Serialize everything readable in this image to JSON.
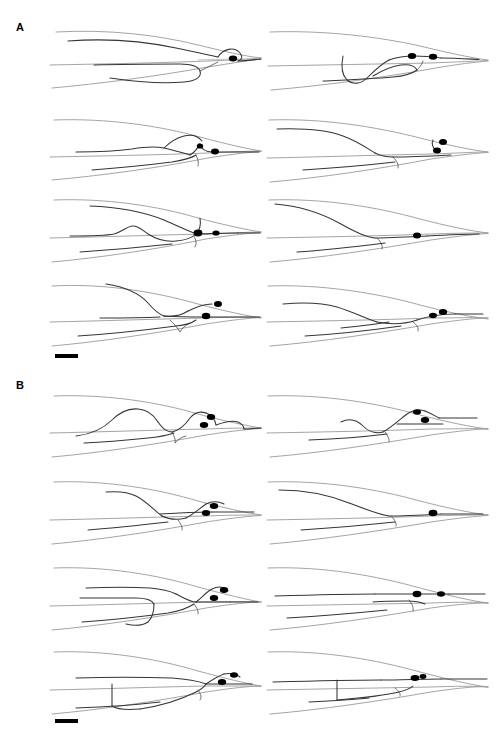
{
  "figure": {
    "type": "neuroanatomical-tracing-figure",
    "width": 503,
    "height": 746,
    "background_color": "#ffffff",
    "guide_line_color": "#9a9a9a",
    "neurite_color": "#353535",
    "soma_color": "#000000"
  },
  "panels": [
    {
      "id": "A",
      "label": "A",
      "label_x": 16,
      "label_y": 22,
      "rows": 4,
      "columns": 2,
      "scalebar": {
        "label": "",
        "x": 55,
        "y": 354,
        "width": 23,
        "height": 4
      }
    },
    {
      "id": "B",
      "label": "B",
      "label_x": 16,
      "label_y": 380,
      "rows": 4,
      "columns": 2,
      "scalebar": {
        "label": "",
        "x": 55,
        "y": 719,
        "width": 23,
        "height": 4
      }
    }
  ],
  "cells": [
    {
      "name": "cell-a-r1-c1",
      "panel": "A",
      "row": 1,
      "col": 1,
      "x": 48,
      "y": 18,
      "w": 215,
      "h": 78,
      "soma_count": 1
    },
    {
      "name": "cell-a-r1-c2",
      "panel": "A",
      "row": 1,
      "col": 2,
      "x": 265,
      "y": 18,
      "w": 225,
      "h": 78,
      "soma_count": 2
    },
    {
      "name": "cell-a-r2-c1",
      "panel": "A",
      "row": 2,
      "col": 1,
      "x": 48,
      "y": 108,
      "w": 215,
      "h": 78,
      "soma_count": 2
    },
    {
      "name": "cell-a-r2-c2",
      "panel": "A",
      "row": 2,
      "col": 2,
      "x": 265,
      "y": 108,
      "w": 225,
      "h": 78,
      "soma_count": 2
    },
    {
      "name": "cell-a-r3-c1",
      "panel": "A",
      "row": 3,
      "col": 1,
      "x": 48,
      "y": 188,
      "w": 215,
      "h": 80,
      "soma_count": 2
    },
    {
      "name": "cell-a-r3-c2",
      "panel": "A",
      "row": 3,
      "col": 2,
      "x": 265,
      "y": 188,
      "w": 225,
      "h": 80,
      "soma_count": 1
    },
    {
      "name": "cell-a-r4-c1",
      "panel": "A",
      "row": 4,
      "col": 1,
      "x": 48,
      "y": 270,
      "w": 215,
      "h": 82,
      "soma_count": 2
    },
    {
      "name": "cell-a-r4-c2",
      "panel": "A",
      "row": 4,
      "col": 2,
      "x": 265,
      "y": 270,
      "w": 225,
      "h": 82,
      "soma_count": 2
    },
    {
      "name": "cell-b-r1-c1",
      "panel": "B",
      "row": 1,
      "col": 1,
      "x": 48,
      "y": 382,
      "w": 215,
      "h": 80,
      "soma_count": 2
    },
    {
      "name": "cell-b-r1-c2",
      "panel": "B",
      "row": 1,
      "col": 2,
      "x": 265,
      "y": 382,
      "w": 225,
      "h": 80,
      "soma_count": 2
    },
    {
      "name": "cell-b-r2-c1",
      "panel": "B",
      "row": 2,
      "col": 1,
      "x": 48,
      "y": 468,
      "w": 215,
      "h": 80,
      "soma_count": 2
    },
    {
      "name": "cell-b-r2-c2",
      "panel": "B",
      "row": 2,
      "col": 2,
      "x": 265,
      "y": 468,
      "w": 225,
      "h": 80,
      "soma_count": 2
    },
    {
      "name": "cell-b-r3-c1",
      "panel": "B",
      "row": 3,
      "col": 1,
      "x": 48,
      "y": 556,
      "w": 215,
      "h": 80,
      "soma_count": 2
    },
    {
      "name": "cell-b-r3-c2",
      "panel": "B",
      "row": 3,
      "col": 2,
      "x": 265,
      "y": 556,
      "w": 225,
      "h": 80,
      "soma_count": 2
    },
    {
      "name": "cell-b-r4-c1",
      "panel": "B",
      "row": 4,
      "col": 1,
      "x": 48,
      "y": 640,
      "w": 215,
      "h": 80,
      "soma_count": 2
    },
    {
      "name": "cell-b-r4-c2",
      "panel": "B",
      "row": 4,
      "col": 2,
      "x": 265,
      "y": 640,
      "w": 225,
      "h": 80,
      "soma_count": 2
    }
  ]
}
